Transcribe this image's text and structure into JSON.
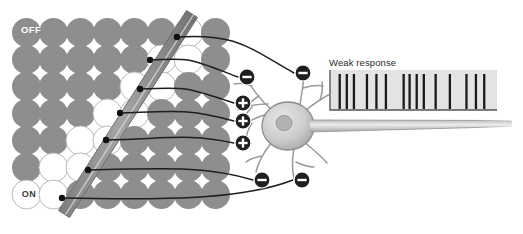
{
  "figure": {
    "type": "neuroscience-diagram"
  },
  "receptive_field": {
    "off_label": "OFF",
    "on_label": "ON",
    "grid": {
      "rows": 7,
      "cols": 8,
      "cell": 27,
      "origin_x": 12,
      "origin_y": 18,
      "radius": 14.5,
      "filled_color": "#8e8e8e",
      "empty_color": "#ffffff",
      "empty_stroke": "#b9b9b9",
      "empty_cells": [
        {
          "row": 0,
          "col": 6
        },
        {
          "row": 1,
          "col": 5
        },
        {
          "row": 1,
          "col": 6
        },
        {
          "row": 2,
          "col": 4
        },
        {
          "row": 2,
          "col": 5
        },
        {
          "row": 3,
          "col": 3
        },
        {
          "row": 3,
          "col": 4
        },
        {
          "row": 4,
          "col": 2
        },
        {
          "row": 4,
          "col": 3
        },
        {
          "row": 5,
          "col": 1
        },
        {
          "row": 5,
          "col": 2
        },
        {
          "row": 6,
          "col": 0
        },
        {
          "row": 6,
          "col": 1
        }
      ]
    },
    "stimulus_bar": {
      "label": "light-bar",
      "color": "#8a8a8a",
      "edge_color": "#6e6e6e",
      "x1": 192,
      "y1": 14,
      "x2": 64,
      "y2": 214,
      "width": 13
    }
  },
  "synapses": [
    {
      "id": 0,
      "sign": "-",
      "dot_x": 177,
      "dot_y": 37,
      "badge_x": 303,
      "badge_y": 73
    },
    {
      "id": 1,
      "sign": "-",
      "dot_x": 150,
      "dot_y": 60,
      "badge_x": 247,
      "badge_y": 77
    },
    {
      "id": 2,
      "sign": "+",
      "dot_x": 140,
      "dot_y": 89,
      "badge_x": 243,
      "badge_y": 103
    },
    {
      "id": 3,
      "sign": "+",
      "dot_x": 120,
      "dot_y": 113,
      "badge_x": 243,
      "badge_y": 121
    },
    {
      "id": 4,
      "sign": "+",
      "dot_x": 106,
      "dot_y": 140,
      "badge_x": 243,
      "badge_y": 143
    },
    {
      "id": 5,
      "sign": "-",
      "dot_x": 88,
      "dot_y": 170,
      "badge_x": 262,
      "badge_y": 180
    },
    {
      "id": 6,
      "sign": "-",
      "dot_x": 62,
      "dot_y": 198,
      "badge_x": 302,
      "badge_y": 180
    }
  ],
  "badge": {
    "plus_symbol": "+",
    "minus_symbol": "−",
    "fill": "#1f1f1f",
    "symbol_color": "#ffffff",
    "radius": 8
  },
  "neuron": {
    "soma_x": 288,
    "soma_y": 126,
    "soma_rx": 26,
    "soma_ry": 24,
    "nucleus_rx": 8,
    "body_color": "#c9c9c9",
    "outline_color": "#8c8c8c",
    "axon": {
      "x1": 312,
      "y1": 126,
      "x2": 512,
      "y2": 122,
      "thickness": 7
    }
  },
  "response_panel": {
    "label": "Weak response",
    "x": 329,
    "y": 70,
    "width": 168,
    "height": 40,
    "background": "#e3e3e3",
    "baseline_color": "#555555",
    "spike_color": "#1a1a1a",
    "spike_positions": [
      3,
      9,
      15,
      26,
      34,
      42,
      57,
      62,
      68,
      74,
      84,
      96,
      110,
      118,
      125
    ],
    "spike_count": 15
  }
}
